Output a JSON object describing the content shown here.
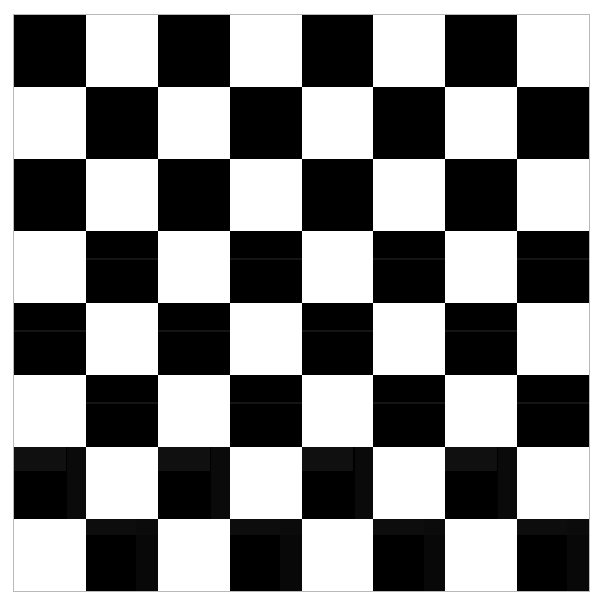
{
  "image": {
    "kind": "checkerboard-pattern",
    "width": 605,
    "height": 609,
    "background_color": "#ffffff",
    "title": "Checkerboard"
  },
  "board": {
    "name": "checkerboard",
    "rows": 8,
    "columns": 8,
    "square_count": 64,
    "dark_square_count": 32,
    "light_square_count": 32,
    "top_left_square_color": "dark",
    "dark_color": "#000000",
    "light_color": "#ffffff",
    "border_color": "#b9b9b9",
    "border_width_px": 1,
    "left_px": 13,
    "top_px": 14,
    "width_px": 577,
    "height_px": 578,
    "square_size_px": 72,
    "grid": [
      [
        "dark",
        "light",
        "dark",
        "light",
        "dark",
        "light",
        "dark",
        "light"
      ],
      [
        "light",
        "dark",
        "light",
        "dark",
        "light",
        "dark",
        "light",
        "dark"
      ],
      [
        "dark",
        "light",
        "dark",
        "light",
        "dark",
        "light",
        "dark",
        "light"
      ],
      [
        "light",
        "dark",
        "light",
        "dark",
        "light",
        "dark",
        "light",
        "dark"
      ],
      [
        "dark",
        "light",
        "dark",
        "light",
        "dark",
        "light",
        "dark",
        "light"
      ],
      [
        "light",
        "dark",
        "light",
        "dark",
        "light",
        "dark",
        "light",
        "dark"
      ],
      [
        "dark",
        "light",
        "dark",
        "light",
        "dark",
        "light",
        "dark",
        "light"
      ],
      [
        "light",
        "dark",
        "light",
        "dark",
        "light",
        "dark",
        "light",
        "dark"
      ]
    ]
  }
}
